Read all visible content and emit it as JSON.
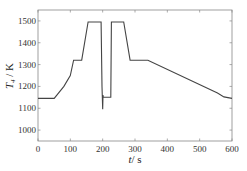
{
  "chart_data": {
    "type": "line",
    "title": "",
    "xlabel": "t / s",
    "ylabel": "T4 / K",
    "xlim": [
      0,
      600
    ],
    "ylim": [
      950,
      1550
    ],
    "xticks": [
      0,
      100,
      200,
      300,
      400,
      500,
      600
    ],
    "yticks": [
      1000,
      1100,
      1200,
      1300,
      1400,
      1500
    ],
    "grid": false,
    "legend": null,
    "series": [
      {
        "name": "T4",
        "color": "#444444",
        "x": [
          0,
          50,
          80,
          100,
          110,
          135,
          155,
          195,
          198,
          200,
          201,
          202,
          225,
          227,
          265,
          285,
          340,
          555,
          575,
          600
        ],
        "y": [
          1145,
          1145,
          1200,
          1250,
          1320,
          1320,
          1495,
          1495,
          1200,
          1095,
          1160,
          1150,
          1150,
          1495,
          1495,
          1320,
          1320,
          1170,
          1152,
          1145
        ]
      }
    ]
  },
  "axes": {
    "x_label_var": "t",
    "x_label_unit": "s",
    "y_label_var": "T",
    "y_label_sub": "4",
    "y_label_unit": "K"
  }
}
